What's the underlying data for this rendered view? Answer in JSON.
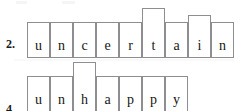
{
  "worksheet": {
    "type": "word-shape-spelling-boxes",
    "background_color": "#ffffff",
    "box_border_color": "#8d8d92",
    "text_color": "#161616",
    "rows": [
      {
        "number_label": "2.",
        "word": "uncertain",
        "cells": [
          {
            "letter": "u",
            "shape": "base"
          },
          {
            "letter": "n",
            "shape": "base"
          },
          {
            "letter": "c",
            "shape": "base"
          },
          {
            "letter": "e",
            "shape": "base"
          },
          {
            "letter": "r",
            "shape": "base"
          },
          {
            "letter": "t",
            "shape": "tall"
          },
          {
            "letter": "a",
            "shape": "base"
          },
          {
            "letter": "i",
            "shape": "mid"
          },
          {
            "letter": "n",
            "shape": "base"
          }
        ]
      },
      {
        "number_label": "4.",
        "word": "unhappy",
        "cells": [
          {
            "letter": "u",
            "shape": "base"
          },
          {
            "letter": "n",
            "shape": "base"
          },
          {
            "letter": "h",
            "shape": "tall"
          },
          {
            "letter": "a",
            "shape": "base"
          },
          {
            "letter": "p",
            "shape": "base"
          },
          {
            "letter": "p",
            "shape": "base"
          },
          {
            "letter": "y",
            "shape": "base"
          }
        ]
      }
    ]
  }
}
